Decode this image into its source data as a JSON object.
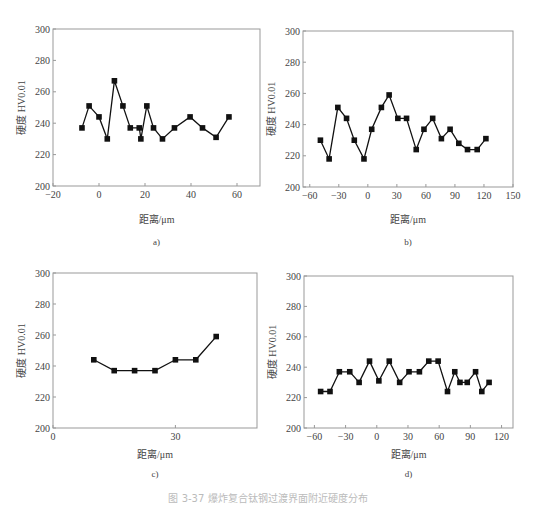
{
  "figure": {
    "caption": "图 3-37  爆炸复合钛钢过渡界面附近硬度分布"
  },
  "chart_data": [
    {
      "type": "line",
      "panel_label": "a)",
      "title": "",
      "xlabel": "距离/μm",
      "ylabel": "硬度 HV0.01",
      "xlim": [
        -20,
        70
      ],
      "ylim": [
        200,
        300
      ],
      "xticks": [
        -20,
        0,
        20,
        40,
        60
      ],
      "yticks": [
        200,
        220,
        240,
        260,
        280,
        300
      ],
      "grid": false,
      "marker": "square",
      "x": [
        -7.4,
        -4.3,
        0,
        3.6,
        6.7,
        10.4,
        13.6,
        17.5,
        18.2,
        20.8,
        23.7,
        27.6,
        32.8,
        39.6,
        45.0,
        50.9,
        56.5
      ],
      "y": [
        237,
        251,
        244,
        230,
        267,
        251,
        237,
        237,
        230,
        251,
        237,
        230,
        237,
        244,
        237,
        231,
        244
      ]
    },
    {
      "type": "line",
      "panel_label": "b)",
      "title": "",
      "xlabel": "距离/μm",
      "ylabel": "硬度 HV0.01",
      "xlim": [
        -67,
        150
      ],
      "ylim": [
        200,
        300
      ],
      "xticks": [
        -60,
        -30,
        0,
        30,
        60,
        90,
        120,
        150
      ],
      "yticks": [
        200,
        220,
        240,
        260,
        280,
        300
      ],
      "grid": false,
      "marker": "square",
      "x": [
        -49,
        -40,
        -31,
        -22,
        -14,
        -4,
        4,
        14,
        22,
        31,
        40,
        50,
        58,
        67,
        76,
        85,
        94,
        103,
        113,
        122
      ],
      "y": [
        230,
        218,
        251,
        244,
        230,
        218,
        237,
        251,
        259,
        244,
        244,
        224,
        237,
        244,
        231,
        237,
        228,
        224,
        224,
        231
      ]
    },
    {
      "type": "line",
      "panel_label": "c)",
      "title": "",
      "xlabel": "距离/μm",
      "ylabel": "硬度 HV0.01",
      "xlim": [
        0,
        50
      ],
      "ylim": [
        200,
        300
      ],
      "xticks": [
        0,
        30
      ],
      "yticks": [
        200,
        220,
        240,
        260,
        280,
        300
      ],
      "grid": false,
      "marker": "square",
      "x": [
        10,
        15,
        20,
        25,
        30,
        35,
        40
      ],
      "y": [
        244,
        237,
        237,
        237,
        244,
        244,
        259
      ]
    },
    {
      "type": "line",
      "panel_label": "d)",
      "title": "",
      "xlabel": "距离/μm",
      "ylabel": "硬度 HV0.01",
      "xlim": [
        -70,
        131
      ],
      "ylim": [
        200,
        300
      ],
      "xticks": [
        -60,
        -30,
        0,
        30,
        60,
        90,
        120
      ],
      "yticks": [
        200,
        220,
        240,
        260,
        280,
        300
      ],
      "grid": false,
      "marker": "square",
      "x": [
        -54,
        -45,
        -36,
        -26,
        -17,
        -7,
        2,
        12,
        22,
        31,
        41,
        50,
        59,
        68,
        75,
        80,
        87,
        95,
        101,
        108
      ],
      "y": [
        224,
        224,
        237,
        237,
        230,
        244,
        231,
        244,
        230,
        237,
        237,
        244,
        244,
        224,
        237,
        230,
        230,
        237,
        224,
        230
      ]
    }
  ],
  "layout": {
    "panels": [
      {
        "plot": {
          "left": 53,
          "top": 29,
          "right": 260,
          "bottom": 186
        },
        "xlabel_y": 223,
        "label_y": 245
      },
      {
        "plot": {
          "left": 303,
          "top": 31,
          "right": 513,
          "bottom": 187
        },
        "xlabel_y": 223,
        "label_y": 245
      },
      {
        "plot": {
          "left": 53,
          "top": 273,
          "right": 257,
          "bottom": 428
        },
        "xlabel_y": 458,
        "label_y": 477
      },
      {
        "plot": {
          "left": 304,
          "top": 276,
          "right": 513,
          "bottom": 428
        },
        "xlabel_y": 458,
        "label_y": 477
      }
    ]
  }
}
